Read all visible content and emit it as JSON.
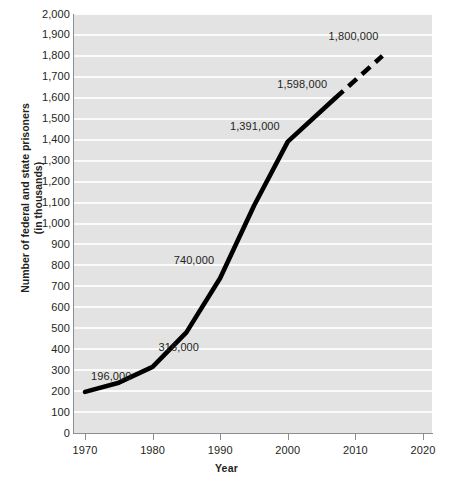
{
  "chart_data": {
    "type": "line",
    "title": "",
    "xlabel": "Year",
    "ylabel": "Number of federal and state prisoners (in thousands)",
    "ylabel_line1": "Number of federal and state prisoners",
    "ylabel_line2": "(in thousands)",
    "xlim": [
      1970,
      2020
    ],
    "ylim": [
      0,
      2000
    ],
    "xticks": [
      "1970",
      "1980",
      "1990",
      "2000",
      "2010",
      "2020"
    ],
    "xtick_values": [
      1970,
      1980,
      1990,
      2000,
      2010,
      2020
    ],
    "yticks": [
      "0",
      "100",
      "200",
      "300",
      "400",
      "500",
      "600",
      "700",
      "800",
      "900",
      "1,000",
      "1,100",
      "1,200",
      "1,300",
      "1,400",
      "1,500",
      "1,600",
      "1,700",
      "1,800",
      "1,900",
      "2,000"
    ],
    "ytick_values": [
      0,
      100,
      200,
      300,
      400,
      500,
      600,
      700,
      800,
      900,
      1000,
      1100,
      1200,
      1300,
      1400,
      1500,
      1600,
      1700,
      1800,
      1900,
      2000
    ],
    "grid": true,
    "grid_color": "#fbfbfb",
    "plot_background": "#e3e3e3",
    "line_color": "#000000",
    "legend": "none",
    "series": [
      {
        "name": "Federal and state prisoners (actual)",
        "style": "solid",
        "x": [
          1970,
          1975,
          1980,
          1985,
          1990,
          1995,
          2000,
          2007
        ],
        "values": [
          196,
          240,
          316,
          480,
          740,
          1085,
          1391,
          1598
        ]
      },
      {
        "name": "Federal and state prisoners (projected)",
        "style": "dashed",
        "x": [
          2007,
          2014
        ],
        "values": [
          1598,
          1800
        ]
      }
    ],
    "annotations": [
      {
        "text": "196,000",
        "x": 1970,
        "y": 196
      },
      {
        "text": "316,000",
        "x": 1980,
        "y": 316
      },
      {
        "text": "740,000",
        "x": 1990,
        "y": 740
      },
      {
        "text": "1,391,000",
        "x": 2000,
        "y": 1391
      },
      {
        "text": "1,598,000",
        "x": 2007,
        "y": 1598
      },
      {
        "text": "1,800,000",
        "x": 2014,
        "y": 1800
      }
    ]
  }
}
